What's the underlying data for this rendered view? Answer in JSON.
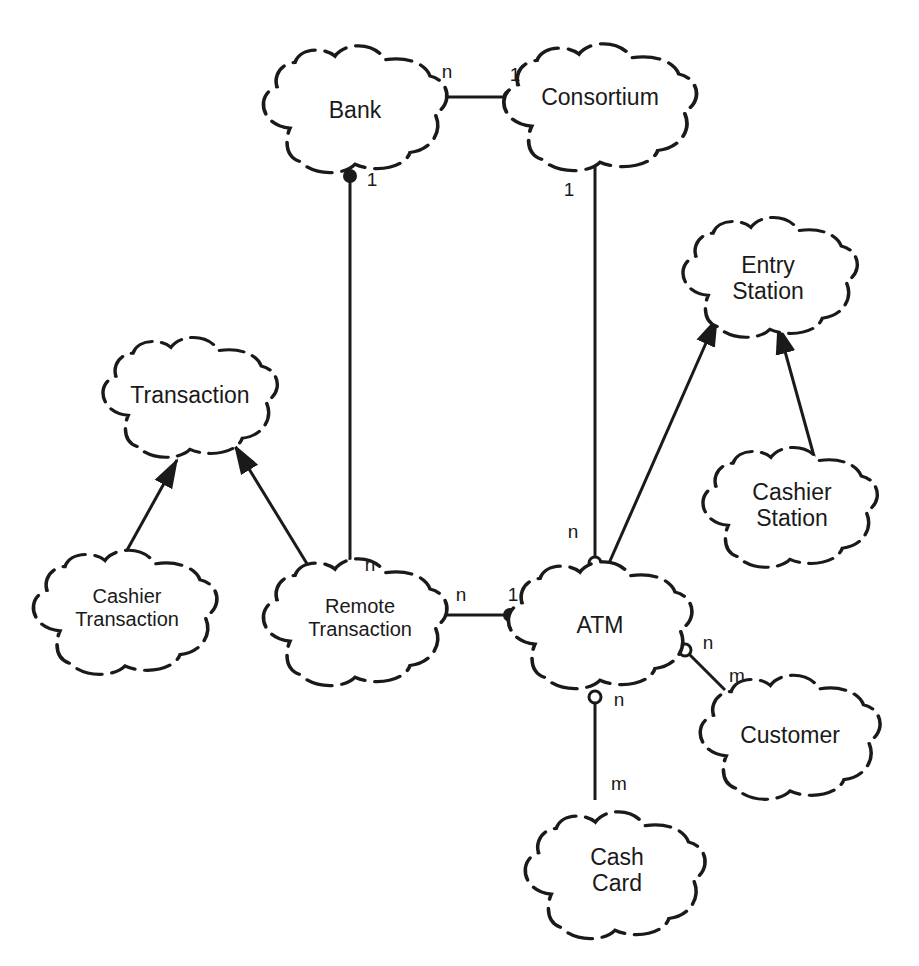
{
  "diagram": {
    "classes": [
      {
        "id": "bank",
        "name": "Bank",
        "cx": 355,
        "cy": 110
      },
      {
        "id": "consortium",
        "name": "Consortium",
        "cx": 597,
        "cy": 100
      },
      {
        "id": "entry_station",
        "name": "Entry Station",
        "cx": 770,
        "cy": 275
      },
      {
        "id": "transaction",
        "name": "Transaction",
        "cx": 190,
        "cy": 395
      },
      {
        "id": "cashier_station",
        "name": "Cashier Station",
        "cx": 790,
        "cy": 505
      },
      {
        "id": "cashier_transaction",
        "name": "Cashier Transaction",
        "cx": 123,
        "cy": 608
      },
      {
        "id": "remote_transaction",
        "name": "Remote Transaction",
        "cx": 357,
        "cy": 618
      },
      {
        "id": "atm",
        "name": "ATM",
        "cx": 600,
        "cy": 620
      },
      {
        "id": "customer",
        "name": "Customer",
        "cx": 790,
        "cy": 735
      },
      {
        "id": "cash_card",
        "name": "Cash Card",
        "cx": 615,
        "cy": 870
      }
    ],
    "relationships": [
      {
        "type": "association",
        "from": "Bank",
        "to": "Consortium",
        "from_mult": "n",
        "to_mult": "1",
        "to_adornment": "open-circle"
      },
      {
        "type": "association",
        "from": "Bank",
        "to": "Remote Transaction",
        "from_mult": "1",
        "to_mult": "n",
        "from_adornment": "filled-circle"
      },
      {
        "type": "association",
        "from": "Consortium",
        "to": "ATM",
        "from_mult": "1",
        "to_mult": "n",
        "to_adornment": "open-circle"
      },
      {
        "type": "inheritance",
        "from": "ATM",
        "to": "Entry Station"
      },
      {
        "type": "inheritance",
        "from": "Cashier Station",
        "to": "Entry Station"
      },
      {
        "type": "inheritance",
        "from": "Cashier Transaction",
        "to": "Transaction"
      },
      {
        "type": "inheritance",
        "from": "Remote Transaction",
        "to": "Transaction"
      },
      {
        "type": "association",
        "from": "Remote Transaction",
        "to": "ATM",
        "from_mult": "n",
        "to_mult": "1",
        "to_adornment": "filled-circle"
      },
      {
        "type": "association",
        "from": "ATM",
        "to": "Customer",
        "from_mult": "n",
        "to_mult": "m",
        "from_adornment": "open-circle"
      },
      {
        "type": "association",
        "from": "ATM",
        "to": "Cash Card",
        "from_mult": "n",
        "to_mult": "m",
        "from_adornment": "open-circle"
      }
    ],
    "labels": {
      "bank": "Bank",
      "consortium": "Consortium",
      "entry_station_1": "Entry",
      "entry_station_2": "Station",
      "transaction": "Transaction",
      "cashier_station_1": "Cashier",
      "cashier_station_2": "Station",
      "cashier_transaction_1": "Cashier",
      "cashier_transaction_2": "Transaction",
      "remote_transaction_1": "Remote",
      "remote_transaction_2": "Transaction",
      "atm": "ATM",
      "customer": "Customer",
      "cash_card_1": "Cash",
      "cash_card_2": "Card"
    },
    "multiplicities": {
      "bank_consortium_n": "n",
      "bank_consortium_1": "1",
      "bank_remote_1": "1",
      "consortium_atm_1": "1",
      "consortium_atm_n": "n",
      "remote_bank_n": "n",
      "remote_atm_n": "n",
      "remote_atm_1": "1",
      "atm_customer_n": "n",
      "atm_customer_m": "m",
      "atm_cashcard_n": "n",
      "atm_cashcard_m": "m"
    },
    "colors": {
      "stroke": "#1a1a1a",
      "background": "#ffffff"
    }
  }
}
